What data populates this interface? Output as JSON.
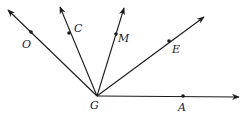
{
  "diagram": {
    "type": "rays-from-common-vertex",
    "vertex": {
      "label": "G",
      "x": 97,
      "y": 96,
      "label_x": 90,
      "label_y": 109
    },
    "rays": [
      {
        "name": "ray-GO",
        "tip": [
          8,
          10
        ],
        "point": {
          "label": "O",
          "x": 31,
          "y": 32,
          "label_x": 22,
          "label_y": 48
        }
      },
      {
        "name": "ray-GC",
        "tip": [
          60,
          7
        ],
        "point": {
          "label": "C",
          "x": 69,
          "y": 33,
          "label_x": 74,
          "label_y": 32
        }
      },
      {
        "name": "ray-GM",
        "tip": [
          124,
          8
        ],
        "point": {
          "label": "M",
          "x": 116,
          "y": 34,
          "label_x": 118,
          "label_y": 42
        }
      },
      {
        "name": "ray-GE",
        "tip": [
          204,
          17
        ],
        "point": {
          "label": "E",
          "x": 169,
          "y": 41,
          "label_x": 172,
          "label_y": 53
        }
      },
      {
        "name": "ray-GA",
        "tip": [
          239,
          97
        ],
        "point": {
          "label": "A",
          "x": 183,
          "y": 96,
          "label_x": 178,
          "label_y": 111
        }
      }
    ],
    "colors": {
      "stroke": "#1a1a1a",
      "background": "#ffffff"
    }
  }
}
